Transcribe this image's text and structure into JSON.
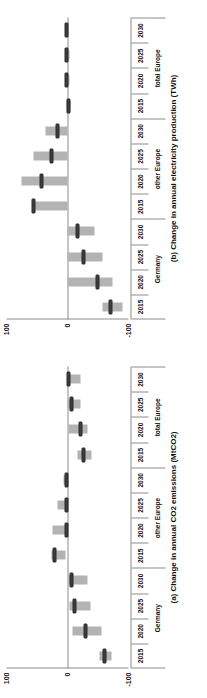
{
  "figure": {
    "background": "#ffffff",
    "bar_color": "#b3b3b3",
    "marker_color": "#3d3d3d",
    "axis_color": "#8c8c8c",
    "orientation_note": "page rendered rotated 90 degrees counter-clockwise"
  },
  "panels": [
    {
      "id": "panel-b",
      "title": "(b) Change in annual electricity production (TWh)",
      "ylabel": "",
      "ylim": [
        -100,
        100
      ],
      "yticks": [
        100,
        0,
        -100
      ],
      "ytick_labels": [
        "100",
        "0",
        "-100"
      ],
      "groups": [
        "Germany",
        "other Europe",
        "total Europe"
      ],
      "years": [
        "2015",
        "2020",
        "2025",
        "2030"
      ]
    },
    {
      "id": "panel-a",
      "title": "(a) Change in annual CO2 emissions (MtCO2)",
      "ylabel": "",
      "ylim": [
        -100,
        100
      ],
      "yticks": [
        100,
        0,
        -100
      ],
      "ytick_labels": [
        "100",
        "0",
        "-100"
      ],
      "groups": [
        "Germany",
        "other Europe",
        "total Europe"
      ],
      "years": [
        "2015",
        "2020",
        "2025",
        "2030"
      ]
    }
  ],
  "chart_data": [
    {
      "type": "bar",
      "id": "panel-a",
      "title": "(a) Change in annual CO2 emissions (MtCO2)",
      "xlabel": "",
      "ylabel": "Change in annual CO2 emissions (MtCO2)",
      "ylim": [
        -100,
        100
      ],
      "yticks": [
        100,
        0,
        -100
      ],
      "grid": false,
      "legend": "none",
      "orientation": "vertical-bars-with-range",
      "categories": [
        "Germany 2015",
        "Germany 2020",
        "Germany 2025",
        "Germany 2030",
        "other Europe 2015",
        "other Europe 2020",
        "other Europe 2025",
        "other Europe 2030",
        "total Europe 2015",
        "total Europe 2020",
        "total Europe 2025",
        "total Europe 2030"
      ],
      "groups": [
        "Germany",
        "other Europe",
        "total Europe"
      ],
      "years": [
        "2015",
        "2020",
        "2025",
        "2030"
      ],
      "series": [
        {
          "name": "range low",
          "values": [
            -72,
            -55,
            -37,
            -33,
            4,
            2,
            2,
            1,
            -40,
            -33,
            -22,
            -22
          ]
        },
        {
          "name": "range high",
          "values": [
            -52,
            -8,
            -3,
            -2,
            26,
            24,
            17,
            7,
            -17,
            -2,
            0,
            0
          ]
        },
        {
          "name": "central estimate",
          "values": [
            -60,
            -30,
            -12,
            -7,
            21,
            1,
            1,
            1,
            -27,
            -21,
            -6,
            -2
          ]
        }
      ]
    },
    {
      "type": "bar",
      "id": "panel-b",
      "title": "(b) Change in annual electricity production (TWh)",
      "xlabel": "",
      "ylabel": "Change in annual electricity production (TWh)",
      "ylim": [
        -100,
        100
      ],
      "yticks": [
        100,
        0,
        -100
      ],
      "grid": false,
      "legend": "none",
      "orientation": "vertical-bars-with-range",
      "categories": [
        "Germany 2015",
        "Germany 2020",
        "Germany 2025",
        "Germany 2030",
        "other Europe 2015",
        "other Europe 2020",
        "other Europe 2025",
        "other Europe 2030",
        "total Europe 2015",
        "total Europe 2020",
        "total Europe 2025",
        "total Europe 2030"
      ],
      "groups": [
        "Germany",
        "other Europe",
        "total Europe"
      ],
      "years": [
        "2015",
        "2020",
        "2025",
        "2030"
      ],
      "series": [
        {
          "name": "range low",
          "values": [
            -90,
            -74,
            -57,
            -44,
            0,
            0,
            0,
            0,
            -5,
            -4,
            -3,
            -2
          ]
        },
        {
          "name": "range high",
          "values": [
            -58,
            0,
            0,
            0,
            58,
            75,
            55,
            36,
            2,
            3,
            3,
            3
          ]
        },
        {
          "name": "central estimate",
          "values": [
            -70,
            -49,
            -27,
            -16,
            55,
            43,
            26,
            16,
            -2,
            1,
            1,
            1
          ]
        }
      ]
    }
  ]
}
